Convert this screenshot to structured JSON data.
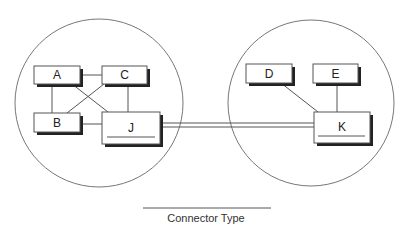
{
  "diagram": {
    "type": "network-topology",
    "colors": {
      "stroke": "#555555",
      "circle_stroke": "#777777",
      "box_fill": "#ffffff",
      "shadow": "#222222",
      "text": "#222222"
    },
    "groups": [
      {
        "id": "left-group",
        "cx": 99,
        "cy": 103,
        "r": 84
      },
      {
        "id": "right-group",
        "cx": 311,
        "cy": 103,
        "r": 83
      }
    ],
    "nodes": [
      {
        "id": "A",
        "label": "A",
        "x": 34,
        "y": 66,
        "w": 46,
        "h": 18,
        "underline": false
      },
      {
        "id": "C",
        "label": "C",
        "x": 102,
        "y": 66,
        "w": 45,
        "h": 18,
        "underline": false
      },
      {
        "id": "B",
        "label": "B",
        "x": 34,
        "y": 113,
        "w": 46,
        "h": 19,
        "underline": false
      },
      {
        "id": "J",
        "label": "J",
        "x": 102,
        "y": 112,
        "w": 58,
        "h": 32,
        "underline": true
      },
      {
        "id": "D",
        "label": "D",
        "x": 246,
        "y": 64,
        "w": 46,
        "h": 19,
        "underline": false
      },
      {
        "id": "E",
        "label": "E",
        "x": 313,
        "y": 64,
        "w": 45,
        "h": 19,
        "underline": false
      },
      {
        "id": "K",
        "label": "K",
        "x": 314,
        "y": 112,
        "w": 56,
        "h": 31,
        "underline": true
      }
    ],
    "edges": [
      {
        "from": "A",
        "to": "C"
      },
      {
        "from": "A",
        "to": "B"
      },
      {
        "from": "A",
        "to": "J"
      },
      {
        "from": "C",
        "to": "B"
      },
      {
        "from": "C",
        "to": "J"
      },
      {
        "from": "B",
        "to": "J"
      },
      {
        "from": "D",
        "to": "K"
      },
      {
        "from": "E",
        "to": "K"
      }
    ],
    "connector": {
      "from": "J",
      "to": "K",
      "style": "double-line"
    },
    "legend": {
      "label": "Connector Type"
    }
  }
}
